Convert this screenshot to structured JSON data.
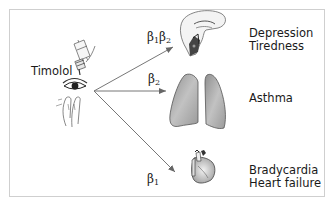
{
  "drug": {
    "label": "Timolol"
  },
  "pathways": [
    {
      "receptor": "β",
      "subs": [
        "1",
        "2"
      ],
      "receptor_text": "β1β2",
      "organ": "brain",
      "effects": [
        "Depression",
        "Tiredness"
      ]
    },
    {
      "receptor": "β",
      "subs": [
        "2"
      ],
      "receptor_text": "β2",
      "organ": "lungs",
      "effects": [
        "Asthma"
      ]
    },
    {
      "receptor": "β",
      "subs": [
        "1"
      ],
      "receptor_text": "β1",
      "organ": "heart",
      "effects": [
        "Bradycardia",
        "Heart failure"
      ]
    }
  ],
  "beta_symbol": "β",
  "sub1": "1",
  "sub2": "2",
  "colors": {
    "frame": "#cfcfcf",
    "arrow": "#777777",
    "lung_fill": "#a9a9a9",
    "text": "#1a1a1a"
  }
}
